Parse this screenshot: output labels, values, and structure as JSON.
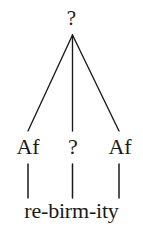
{
  "figure": {
    "type": "morphology-tree",
    "background_color": "#ffffff",
    "ink_color": "#1a1a1a"
  },
  "tree": {
    "root": {
      "label": "?"
    },
    "children": [
      {
        "label": "Af",
        "position": "left"
      },
      {
        "label": "?",
        "position": "middle"
      },
      {
        "label": "Af",
        "position": "right"
      }
    ],
    "base": {
      "text": "re-birm-ity",
      "morphemes": [
        "re",
        "birm",
        "ity"
      ],
      "separator": "-"
    }
  },
  "edges": {
    "branches": [
      {
        "from": "root",
        "to": "left",
        "style": "solid"
      },
      {
        "from": "root",
        "to": "middle",
        "style": "solid"
      },
      {
        "from": "root",
        "to": "right",
        "style": "solid"
      }
    ],
    "stems": [
      {
        "from": "left",
        "to": "morpheme-re",
        "style": "solid"
      },
      {
        "from": "middle",
        "to": "morpheme-birm",
        "style": "solid"
      },
      {
        "from": "right",
        "to": "morpheme-ity",
        "style": "solid"
      }
    ]
  }
}
